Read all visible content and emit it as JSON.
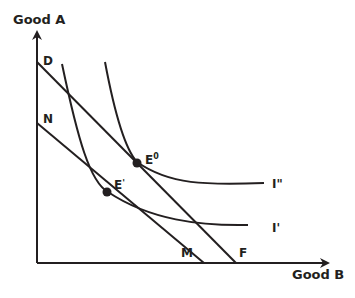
{
  "diagram": {
    "type": "indifference-curve-budget-line",
    "axes": {
      "y_label": "Good A",
      "x_label": "Good B"
    },
    "budget_lines": [
      {
        "name": "DF",
        "start_label": "D",
        "end_label": "F"
      },
      {
        "name": "NM",
        "start_label": "N",
        "end_label": "M"
      }
    ],
    "indifference_curves": [
      {
        "name": "I''",
        "label": "I\""
      },
      {
        "name": "I'",
        "label": "I'"
      }
    ],
    "equilibrium_points": [
      {
        "name": "E0",
        "label_main": "E",
        "label_sup": "0"
      },
      {
        "name": "E'",
        "label_main": "E",
        "label_sup": "'"
      }
    ],
    "colors": {
      "line": "#231f20",
      "background": "#ffffff"
    }
  }
}
